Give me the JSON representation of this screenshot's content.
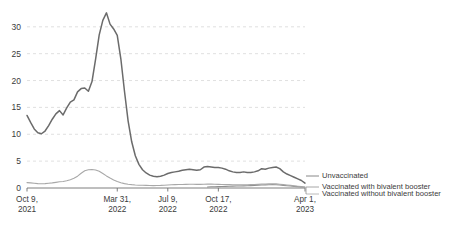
{
  "chart_data": {
    "type": "line",
    "title": "",
    "subtitle": "",
    "xlabel": "",
    "ylabel": "",
    "ylim": [
      0,
      33.5
    ],
    "grid": true,
    "grid_axis": "y",
    "legend_position": "right-bottom",
    "y_ticks": [
      "0",
      "5",
      "10",
      "15",
      "20",
      "25",
      "30"
    ],
    "y_tick_values": [
      0,
      5,
      10,
      15,
      20,
      25,
      30
    ],
    "x_ticks": [
      {
        "label_line1": "Oct 9,",
        "label_line2": "2021",
        "index": 0
      },
      {
        "label_line1": "Mar 31,",
        "label_line2": "2022",
        "index": 25
      },
      {
        "label_line1": "Jul 9,",
        "label_line2": "2022",
        "index": 39
      },
      {
        "label_line1": "Oct 17,",
        "label_line2": "2022",
        "index": 53
      },
      {
        "label_line1": "Apr 1,",
        "label_line2": "2023",
        "index": 77
      }
    ],
    "x_count": 78,
    "series": [
      {
        "name": "Unvaccinated",
        "color": "#6b6b6b",
        "width": 1.5,
        "values": [
          13.5,
          12.2,
          11.0,
          10.3,
          10.1,
          10.6,
          11.6,
          12.8,
          13.8,
          14.4,
          13.6,
          14.9,
          16.0,
          16.4,
          17.9,
          18.5,
          18.6,
          18.0,
          19.8,
          24.0,
          28.5,
          31.2,
          32.6,
          30.5,
          29.6,
          28.4,
          24.0,
          18.0,
          12.5,
          8.6,
          6.0,
          4.4,
          3.4,
          2.8,
          2.4,
          2.2,
          2.1,
          2.2,
          2.4,
          2.7,
          2.9,
          3.0,
          3.1,
          3.3,
          3.4,
          3.5,
          3.4,
          3.3,
          3.4,
          3.9,
          4.0,
          3.9,
          3.8,
          3.8,
          3.7,
          3.5,
          3.2,
          3.0,
          2.9,
          2.9,
          3.0,
          2.9,
          2.9,
          3.0,
          3.2,
          3.6,
          3.5,
          3.7,
          3.8,
          3.9,
          3.6,
          3.0,
          2.6,
          2.3,
          2.0,
          1.7,
          1.4,
          0.9
        ]
      },
      {
        "name": "Vaccinated with bivalent booster",
        "color": "#8f8f8f",
        "width": 1.1,
        "values": [
          null,
          null,
          null,
          null,
          null,
          null,
          null,
          null,
          null,
          null,
          null,
          null,
          null,
          null,
          null,
          null,
          null,
          null,
          null,
          null,
          null,
          null,
          null,
          null,
          null,
          null,
          null,
          null,
          null,
          null,
          null,
          null,
          null,
          null,
          null,
          null,
          null,
          null,
          null,
          null,
          null,
          null,
          null,
          null,
          null,
          null,
          null,
          null,
          null,
          null,
          0.2,
          0.22,
          0.24,
          0.26,
          0.28,
          0.3,
          0.32,
          0.34,
          0.36,
          0.38,
          0.4,
          0.42,
          0.44,
          0.46,
          0.5,
          0.55,
          0.58,
          0.6,
          0.62,
          0.6,
          0.55,
          0.48,
          0.42,
          0.36,
          0.3,
          0.25,
          0.2,
          0.15
        ]
      },
      {
        "name": "Vaccinated without bivalent booster",
        "color": "#a8a8a8",
        "width": 1.1,
        "values": [
          1.0,
          0.95,
          0.88,
          0.82,
          0.8,
          0.82,
          0.88,
          0.95,
          1.05,
          1.15,
          1.2,
          1.35,
          1.55,
          1.8,
          2.2,
          2.75,
          3.2,
          3.4,
          3.45,
          3.35,
          3.1,
          2.7,
          2.25,
          1.85,
          1.5,
          1.2,
          0.98,
          0.82,
          0.7,
          0.62,
          0.56,
          0.52,
          0.5,
          0.48,
          0.46,
          0.45,
          0.46,
          0.48,
          0.52,
          0.56,
          0.6,
          0.62,
          0.64,
          0.66,
          0.68,
          0.7,
          0.7,
          0.68,
          0.68,
          0.7,
          0.72,
          0.72,
          0.7,
          0.68,
          0.66,
          0.64,
          0.62,
          0.6,
          0.58,
          0.58,
          0.6,
          0.6,
          0.62,
          0.64,
          0.68,
          0.72,
          0.74,
          0.76,
          0.78,
          0.76,
          0.7,
          0.62,
          0.55,
          0.48,
          0.4,
          0.33,
          0.26,
          0.18
        ]
      }
    ],
    "legend": [
      {
        "label": "Unvaccinated",
        "color": "#6b6b6b"
      },
      {
        "label": "Vaccinated with bivalent booster",
        "color": "#8f8f8f"
      },
      {
        "label": "Vaccinated without bivalent booster",
        "color": "#a8a8a8"
      }
    ]
  }
}
